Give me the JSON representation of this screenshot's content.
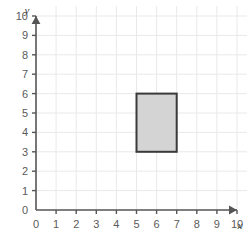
{
  "figure": {
    "title": "",
    "background_color": "#ffffff",
    "grid_color": "#e9e9e9",
    "axis_color": "#555555",
    "label_color": "#5a5a5a"
  },
  "axes": {
    "x": {
      "name": "x",
      "ticks": [
        0,
        1,
        2,
        3,
        4,
        5,
        6,
        7,
        8,
        9,
        10
      ],
      "tick_labels": [
        "0",
        "1",
        "2",
        "3",
        "4",
        "5",
        "6",
        "7",
        "8",
        "9",
        "10"
      ],
      "min": 0,
      "max": 10,
      "arrow": true
    },
    "y": {
      "name": "y",
      "ticks": [
        0,
        1,
        2,
        3,
        4,
        5,
        6,
        7,
        8,
        9,
        10
      ],
      "tick_labels": [
        "0",
        "1",
        "2",
        "3",
        "4",
        "5",
        "6",
        "7",
        "8",
        "9",
        "10"
      ],
      "min": 0,
      "max": 10,
      "arrow": true
    }
  },
  "chart_data": {
    "type": "scatter",
    "title": "",
    "xlabel": "x",
    "ylabel": "y",
    "xlim": [
      0,
      10
    ],
    "ylim": [
      0,
      10
    ],
    "grid": true,
    "legend": "none",
    "x_ticks": [
      0,
      1,
      2,
      3,
      4,
      5,
      6,
      7,
      8,
      9,
      10
    ],
    "y_ticks": [
      0,
      1,
      2,
      3,
      4,
      5,
      6,
      7,
      8,
      9,
      10
    ],
    "shapes": [
      {
        "name": "rectangle",
        "type": "rectangle",
        "x_min": 5,
        "x_max": 7,
        "y_min": 3,
        "y_max": 6,
        "width": 2,
        "height": 3,
        "area": 6,
        "perimeter": 10,
        "vertices": [
          [
            5,
            3
          ],
          [
            7,
            3
          ],
          [
            7,
            6
          ],
          [
            5,
            6
          ]
        ],
        "fill_color": "#d4d4d4",
        "stroke_color": "#3a3a3a",
        "stroke_width": 2
      }
    ]
  }
}
